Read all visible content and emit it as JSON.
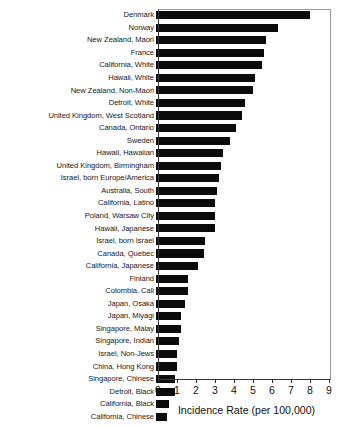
{
  "chart_data": {
    "type": "bar",
    "orientation": "horizontal",
    "title": "",
    "xlabel": "Incidence Rate (per 100,000)",
    "ylabel": "",
    "xlim": [
      0,
      9
    ],
    "xticks": [
      0,
      1,
      2,
      3,
      4,
      5,
      6,
      7,
      8,
      9
    ],
    "xtick_labels": [
      "0",
      "1",
      "2",
      "3",
      "4",
      "5",
      "6",
      "7",
      "8",
      "9"
    ],
    "grid": false,
    "legend": null,
    "bar_color": "#0b0b0c",
    "categories": [
      "Denmark",
      "Norway",
      "New Zealand, Maori",
      "France",
      "California, White",
      "Hawaii, White",
      "New Zealand, Non-Maori",
      "Detroit, White",
      "United Kingdom, West Scotland",
      "Canada, Ontario",
      "Sweden",
      "Hawaii, Hawaiian",
      "United Kingdom, Birmingham",
      "Israel, born Europe/America",
      "Australia, South",
      "California, Latino",
      "Poland, Warsaw City",
      "Hawaii, Japanese",
      "Israel, born Israel",
      "Canada, Quebec",
      "California, Japanese",
      "Finland",
      "Colombia, Cali",
      "Japan, Osaka",
      "Japan, Miyagi",
      "Singapore, Malay",
      "Singapore, Indian",
      "Israel, Non-Jews",
      "China, Hong Kong",
      "Singapore, Chinese",
      "Detroit, Black",
      "California, Black",
      "California, Chinese"
    ],
    "values": [
      8.1,
      6.4,
      5.8,
      5.7,
      5.6,
      5.2,
      5.1,
      4.7,
      4.5,
      4.2,
      3.9,
      3.5,
      3.4,
      3.3,
      3.2,
      3.1,
      3.1,
      3.1,
      2.6,
      2.5,
      2.2,
      1.7,
      1.7,
      1.5,
      1.3,
      1.3,
      1.2,
      1.1,
      1.1,
      1.0,
      1.0,
      0.7,
      0.6
    ]
  },
  "axis": {
    "x_title": "Incidence Rate (per 100,000)"
  }
}
